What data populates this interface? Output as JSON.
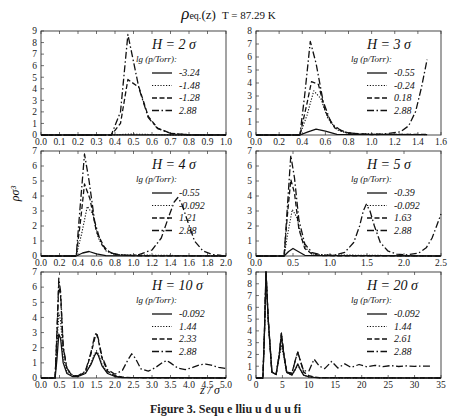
{
  "figure": {
    "title_main": "ρ",
    "title_sub": "eq.",
    "title_arg": "(z)",
    "title_temp": "T = 87.29 K",
    "ylabel": "ρσ³",
    "xlabel": "z / σ",
    "caption": "Figure 3. Sequ  e  lliu  u  d  u  u   fi"
  },
  "chart_data": [
    {
      "type": "line",
      "panel": "H = 2 σ",
      "legend_title": "lg (p/Torr):",
      "xlim": [
        0.0,
        1.0
      ],
      "ylim": [
        0,
        9
      ],
      "xticks": [
        "0.0",
        "0.1",
        "0.2",
        "0.3",
        "0.4",
        "0.5",
        "0.6",
        "0.7",
        "0.8",
        "0.9",
        "1.0"
      ],
      "yticks": [
        "0",
        "1",
        "2",
        "3",
        "4",
        "5",
        "6",
        "7",
        "8",
        "9"
      ],
      "series": [
        {
          "name": "-3.24",
          "style": "solid",
          "x": [
            0,
            0.38,
            1.0
          ],
          "y": [
            0,
            0.02,
            0
          ]
        },
        {
          "name": "-1.48",
          "style": "dotted",
          "x": [
            0,
            0.38,
            0.48,
            0.55,
            0.65,
            1.0
          ],
          "y": [
            0,
            0,
            0.08,
            0.06,
            0.02,
            0
          ]
        },
        {
          "name": "-1.28",
          "style": "dashed",
          "x": [
            0,
            0.38,
            0.43,
            0.47,
            0.53,
            0.58,
            0.63,
            0.7,
            0.8,
            1.0
          ],
          "y": [
            0,
            0,
            1.0,
            4.8,
            4.1,
            1.6,
            0.6,
            0.15,
            0.02,
            0
          ]
        },
        {
          "name": "2.88",
          "style": "dashdot",
          "x": [
            0,
            0.38,
            0.43,
            0.47,
            0.53,
            0.58,
            0.63,
            0.7,
            0.8,
            1.0
          ],
          "y": [
            0,
            0,
            2.0,
            8.7,
            4.0,
            1.5,
            0.55,
            0.15,
            0.02,
            0
          ]
        }
      ]
    },
    {
      "type": "line",
      "panel": "H = 3 σ",
      "legend_title": "lg (p/Torr):",
      "xlim": [
        0.0,
        1.6
      ],
      "ylim": [
        0,
        8
      ],
      "xticks": [
        "0.0",
        "0.2",
        "0.4",
        "0.6",
        "0.8",
        "1.0",
        "1.2",
        "1.4",
        "1.6"
      ],
      "yticks": [
        "0",
        "1",
        "2",
        "3",
        "4",
        "5",
        "6",
        "7",
        "8"
      ],
      "series": [
        {
          "name": "-0.55",
          "style": "solid",
          "x": [
            0,
            0.38,
            0.45,
            0.52,
            0.6,
            0.7,
            1.48
          ],
          "y": [
            0,
            0,
            0.25,
            0.45,
            0.3,
            0.05,
            0.02
          ]
        },
        {
          "name": "-0.24",
          "style": "dotted",
          "x": [
            0,
            0.38,
            0.44,
            0.5,
            0.56,
            0.62,
            0.7,
            0.8,
            1.48
          ],
          "y": [
            0,
            0,
            1.5,
            3.4,
            2.8,
            1.3,
            0.4,
            0.1,
            0.03
          ]
        },
        {
          "name": "0.18",
          "style": "dashed",
          "x": [
            0,
            0.38,
            0.44,
            0.48,
            0.54,
            0.6,
            0.68,
            0.8,
            1.0,
            1.48
          ],
          "y": [
            0,
            0,
            2.4,
            4.1,
            3.9,
            1.8,
            0.55,
            0.15,
            0.04,
            0.05
          ]
        },
        {
          "name": "2.88",
          "style": "dashdot",
          "x": [
            0,
            0.38,
            0.42,
            0.47,
            0.52,
            0.58,
            0.65,
            0.75,
            0.9,
            1.1,
            1.25,
            1.32,
            1.38,
            1.43,
            1.48
          ],
          "y": [
            0,
            0,
            3.0,
            7.2,
            5.5,
            2.6,
            0.9,
            0.25,
            0.06,
            0.06,
            0.25,
            0.7,
            1.8,
            3.6,
            5.8
          ]
        }
      ]
    },
    {
      "type": "line",
      "panel": "H = 4 σ",
      "legend_title": "lg (p/Torr):",
      "xlim": [
        0.0,
        2.0
      ],
      "ylim": [
        0,
        7
      ],
      "xticks": [
        "0.0",
        "0.2",
        "0.4",
        "0.6",
        "0.8",
        "1.0",
        "1.2",
        "1.4",
        "1.6",
        "1.8",
        "2.0"
      ],
      "yticks": [
        "0",
        "1",
        "2",
        "3",
        "4",
        "5",
        "6",
        "7"
      ],
      "series": [
        {
          "name": "-0.55",
          "style": "solid",
          "x": [
            0,
            0.38,
            0.45,
            0.52,
            0.6,
            0.7,
            2.0
          ],
          "y": [
            0,
            0,
            0.2,
            0.3,
            0.15,
            0.03,
            0
          ]
        },
        {
          "name": "-0.092",
          "style": "dotted",
          "x": [
            0,
            0.38,
            0.44,
            0.5,
            0.56,
            0.62,
            0.7,
            0.8,
            2.0
          ],
          "y": [
            0,
            0,
            1.5,
            3.3,
            2.8,
            1.2,
            0.35,
            0.08,
            0
          ]
        },
        {
          "name": "1.21",
          "style": "dashed",
          "x": [
            0,
            0.38,
            0.43,
            0.47,
            0.53,
            0.6,
            0.7,
            0.8,
            1.0,
            2.0
          ],
          "y": [
            0,
            0,
            2.5,
            4.8,
            3.8,
            1.6,
            0.4,
            0.1,
            0.02,
            0
          ]
        },
        {
          "name": "2.88",
          "style": "dashdot",
          "x": [
            0,
            0.38,
            0.42,
            0.47,
            0.52,
            0.58,
            0.65,
            0.75,
            0.9,
            1.05,
            1.2,
            1.3,
            1.38,
            1.44,
            1.48,
            1.52,
            1.58,
            1.66,
            1.75,
            1.85,
            1.95
          ],
          "y": [
            0,
            0,
            3.0,
            6.8,
            5.0,
            2.3,
            0.8,
            0.2,
            0.05,
            0.08,
            0.4,
            1.2,
            2.6,
            3.6,
            3.9,
            3.5,
            2.4,
            1.0,
            0.35,
            0.1,
            0.04
          ]
        }
      ]
    },
    {
      "type": "line",
      "panel": "H = 5 σ",
      "legend_title": "lg (p/Torr):",
      "xlim": [
        0.0,
        2.5
      ],
      "ylim": [
        0,
        7
      ],
      "xticks": [
        "0.0",
        "0.5",
        "1.0",
        "1.5",
        "2.0",
        "2.5"
      ],
      "yticks": [
        "0",
        "1",
        "2",
        "3",
        "4",
        "5",
        "6",
        "7"
      ],
      "series": [
        {
          "name": "-0.39",
          "style": "solid",
          "x": [
            0,
            0.38,
            0.44,
            0.5,
            0.57,
            0.66,
            2.5
          ],
          "y": [
            0,
            0,
            0.3,
            0.5,
            0.3,
            0.05,
            0
          ]
        },
        {
          "name": "-0.092",
          "style": "dotted",
          "x": [
            0,
            0.38,
            0.43,
            0.49,
            0.55,
            0.62,
            0.7,
            0.8,
            2.5
          ],
          "y": [
            0,
            0,
            1.5,
            3.1,
            2.6,
            1.1,
            0.35,
            0.08,
            0
          ]
        },
        {
          "name": "1.63",
          "style": "dashed",
          "x": [
            0,
            0.38,
            0.42,
            0.47,
            0.52,
            0.58,
            0.66,
            0.76,
            0.9,
            2.5
          ],
          "y": [
            0,
            0,
            2.5,
            5.1,
            4.2,
            1.8,
            0.5,
            0.12,
            0.02,
            0
          ]
        },
        {
          "name": "2.88",
          "style": "dashdot",
          "x": [
            0,
            0.38,
            0.42,
            0.47,
            0.52,
            0.58,
            0.66,
            0.76,
            0.9,
            1.05,
            1.2,
            1.32,
            1.4,
            1.45,
            1.49,
            1.54,
            1.6,
            1.68,
            1.78,
            1.9,
            2.05,
            2.2,
            2.3,
            2.38,
            2.44,
            2.5
          ],
          "y": [
            0,
            0,
            3.0,
            6.7,
            5.2,
            2.4,
            0.8,
            0.22,
            0.06,
            0.05,
            0.25,
            0.9,
            2.0,
            3.0,
            3.45,
            3.0,
            2.0,
            0.9,
            0.35,
            0.12,
            0.08,
            0.2,
            0.55,
            1.2,
            2.0,
            2.8
          ]
        }
      ]
    },
    {
      "type": "line",
      "panel": "H = 10 σ",
      "legend_title": "lg (p/Torr):",
      "xlim": [
        0.0,
        5.0
      ],
      "ylim": [
        0,
        7
      ],
      "xticks": [
        "0.0",
        "0.5",
        "1.0",
        "1.5",
        "2.0",
        "2.5",
        "3.0",
        "3.5",
        "4.0",
        "4.5",
        "5.0"
      ],
      "yticks": [
        "0",
        "1",
        "2",
        "3",
        "4",
        "5",
        "6",
        "7"
      ],
      "series": [
        {
          "name": "-0.092",
          "style": "solid",
          "x": [
            0,
            0.38,
            0.43,
            0.48,
            0.53,
            0.6,
            0.7,
            0.85,
            1.0,
            1.2,
            1.35,
            1.45,
            1.5,
            1.55,
            1.65,
            1.8,
            2.0,
            2.2,
            5.0
          ],
          "y": [
            0,
            0,
            1.2,
            2.9,
            2.6,
            1.0,
            0.3,
            0.1,
            0.1,
            0.3,
            0.9,
            1.5,
            1.7,
            1.5,
            0.8,
            0.3,
            0.1,
            0.03,
            0
          ]
        },
        {
          "name": "1.44",
          "style": "dotted",
          "x": [
            0,
            0.38,
            0.43,
            0.48,
            0.53,
            0.6,
            0.7,
            0.85,
            1.0,
            1.2,
            1.35,
            1.45,
            1.5,
            1.55,
            1.65,
            1.8,
            2.0,
            2.2,
            5.0
          ],
          "y": [
            0,
            0,
            2.0,
            4.3,
            3.8,
            1.4,
            0.4,
            0.1,
            0.1,
            0.3,
            1.0,
            1.6,
            1.8,
            1.6,
            0.9,
            0.35,
            0.1,
            0.03,
            0
          ]
        },
        {
          "name": "2.33",
          "style": "dashed",
          "x": [
            0,
            0.38,
            0.43,
            0.48,
            0.53,
            0.6,
            0.7,
            0.85,
            1.0,
            1.2,
            1.35,
            1.45,
            1.5,
            1.55,
            1.65,
            1.8,
            2.0,
            2.2,
            2.5,
            5.0
          ],
          "y": [
            0,
            0,
            2.8,
            6.2,
            5.4,
            2.0,
            0.6,
            0.15,
            0.12,
            0.4,
            1.6,
            2.6,
            2.9,
            2.5,
            1.3,
            0.45,
            0.15,
            0.06,
            0.02,
            0
          ]
        },
        {
          "name": "2.88",
          "style": "dashdot",
          "x": [
            0,
            0.38,
            0.43,
            0.48,
            0.53,
            0.6,
            0.7,
            0.85,
            1.0,
            1.2,
            1.35,
            1.45,
            1.5,
            1.55,
            1.65,
            1.8,
            2.0,
            2.2,
            2.35,
            2.45,
            2.55,
            2.7,
            2.9,
            3.1,
            3.3,
            3.4,
            3.5,
            3.7,
            3.9,
            4.1,
            4.3,
            4.45,
            4.6,
            4.8,
            5.0
          ],
          "y": [
            0,
            0,
            3.0,
            6.6,
            5.7,
            2.1,
            0.65,
            0.18,
            0.14,
            0.45,
            1.7,
            2.8,
            3.0,
            2.6,
            1.4,
            0.55,
            0.25,
            0.5,
            1.2,
            1.6,
            1.3,
            0.6,
            0.45,
            0.7,
            1.05,
            1.15,
            1.0,
            0.65,
            0.55,
            0.7,
            0.88,
            0.92,
            0.85,
            0.7,
            0.62
          ]
        }
      ]
    },
    {
      "type": "line",
      "panel": "H = 20 σ",
      "legend_title": "lg (p/Torr):",
      "xlim": [
        0,
        35
      ],
      "ylim": [
        0,
        9
      ],
      "xticks": [
        "0",
        "5",
        "10",
        "15",
        "20",
        "25",
        "30",
        "35"
      ],
      "yticks": [
        "0",
        "1",
        "2",
        "3",
        "4",
        "5",
        "6",
        "7",
        "8",
        "9"
      ],
      "series": [
        {
          "name": "-0.092",
          "style": "solid",
          "x": [
            0,
            1.3,
            1.6,
            1.9,
            2.3,
            3.0,
            3.8,
            4.4,
            4.8,
            5.2,
            5.8,
            6.8,
            7.5,
            7.9,
            8.3,
            9.0,
            10,
            11,
            12,
            35
          ],
          "y": [
            0,
            0,
            4.0,
            9.0,
            5.0,
            0.5,
            0.3,
            2.0,
            3.6,
            2.2,
            0.5,
            0.25,
            0.8,
            1.2,
            0.8,
            0.25,
            0.1,
            0.05,
            0.02,
            0
          ]
        },
        {
          "name": "1.44",
          "style": "dotted",
          "x": [
            0,
            1.3,
            1.6,
            1.9,
            2.3,
            3.0,
            3.8,
            4.4,
            4.8,
            5.2,
            5.8,
            6.8,
            7.5,
            7.9,
            8.3,
            9.0,
            10,
            11,
            12,
            35
          ],
          "y": [
            0,
            0,
            4.0,
            8.8,
            4.8,
            0.5,
            0.3,
            1.8,
            2.8,
            1.9,
            0.45,
            0.25,
            0.75,
            1.1,
            0.75,
            0.25,
            0.1,
            0.05,
            0.02,
            0
          ]
        },
        {
          "name": "2.61",
          "style": "dashed",
          "x": [
            0,
            1.3,
            1.6,
            1.9,
            2.3,
            3.0,
            3.8,
            4.4,
            4.8,
            5.2,
            5.8,
            6.8,
            7.5,
            7.9,
            8.3,
            9.0,
            10,
            11,
            12,
            35
          ],
          "y": [
            0,
            0,
            4.0,
            9.0,
            5.0,
            0.5,
            0.3,
            2.0,
            3.8,
            2.2,
            0.5,
            0.4,
            1.6,
            2.2,
            1.6,
            0.5,
            0.2,
            0.08,
            0.03,
            0
          ]
        },
        {
          "name": "2.88",
          "style": "dashdot",
          "x": [
            0,
            1.3,
            1.6,
            1.9,
            2.3,
            3.0,
            3.8,
            4.4,
            4.8,
            5.2,
            5.8,
            6.8,
            7.5,
            7.9,
            8.3,
            9.0,
            10,
            11,
            12,
            13,
            14.3,
            15.5,
            16.8,
            18,
            19.5,
            21,
            22.5,
            24,
            25.5,
            27,
            28.5,
            30,
            31.5,
            33
          ],
          "y": [
            0,
            0,
            4.0,
            9.0,
            5.0,
            0.5,
            0.3,
            2.0,
            3.8,
            2.2,
            0.5,
            0.4,
            1.6,
            2.2,
            1.6,
            0.6,
            0.6,
            1.6,
            1.0,
            0.8,
            1.4,
            0.85,
            1.2,
            0.9,
            1.15,
            0.95,
            1.08,
            0.97,
            1.05,
            0.98,
            1.03,
            0.99,
            1.01,
            1.0
          ]
        }
      ]
    }
  ]
}
